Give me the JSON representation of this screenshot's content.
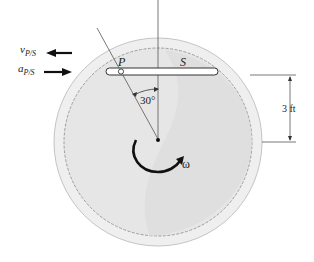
{
  "figure": {
    "labels": {
      "point_p": "P",
      "point_s": "S",
      "angle": "30°",
      "omega": "ω",
      "dimension": "3 ft",
      "velocity_symbol": "v",
      "velocity_subscript": "P/S",
      "acceleration_symbol": "a",
      "acceleration_subscript": "P/S"
    },
    "vectors": {
      "velocity_direction": "left",
      "acceleration_direction": "right"
    },
    "colors": {
      "disk_fill": "#e4e4e4",
      "disk_shadow": "#d6d6d6",
      "rim": "#bdbdbd",
      "ink": "#1a1a1a",
      "line": "#555555"
    }
  }
}
